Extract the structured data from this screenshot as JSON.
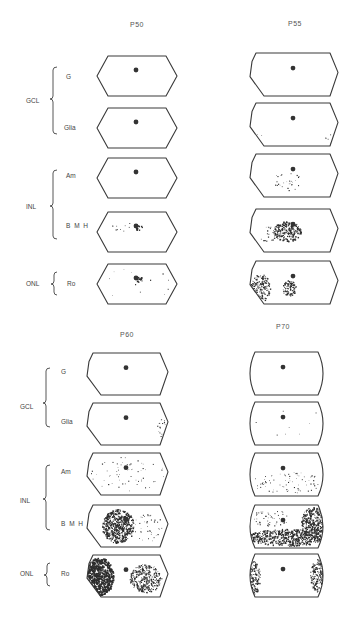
{
  "figure": {
    "panels": [
      {
        "id": "top",
        "groups": [
          {
            "label": "GCL",
            "rows": [
              "G",
              "Glia"
            ]
          },
          {
            "label": "INL",
            "rows": [
              "Am",
              "B M H"
            ]
          },
          {
            "label": "ONL",
            "rows": [
              "Ro"
            ]
          }
        ],
        "columns": [
          {
            "title": "P50"
          },
          {
            "title": "P55"
          }
        ]
      },
      {
        "id": "bottom",
        "groups": [
          {
            "label": "GCL",
            "rows": [
              "G",
              "Glia"
            ]
          },
          {
            "label": "INL",
            "rows": [
              "Am",
              "B M H"
            ]
          },
          {
            "label": "ONL",
            "rows": [
              "Ro"
            ]
          }
        ],
        "columns": [
          {
            "title": "P60"
          },
          {
            "title": "P70"
          }
        ]
      }
    ]
  },
  "chart_data": {
    "type": "heatmap",
    "title": "",
    "ages": [
      "P50",
      "P55",
      "P60",
      "P70"
    ],
    "layers": [
      "GCL",
      "GCL",
      "INL",
      "INL",
      "ONL"
    ],
    "cell_classes": [
      "G",
      "Glia",
      "Am",
      "B M H",
      "Ro"
    ],
    "maps": [
      {
        "age": "P50",
        "class": "G",
        "density": "none",
        "pattern": "optic disc only"
      },
      {
        "age": "P50",
        "class": "Glia",
        "density": "none",
        "pattern": "optic disc only"
      },
      {
        "age": "P50",
        "class": "Am",
        "density": "none",
        "pattern": "optic disc only"
      },
      {
        "age": "P50",
        "class": "B M H",
        "density": "sparse",
        "pattern": "small cluster at optic disc, few scattered left of disc"
      },
      {
        "age": "P50",
        "class": "Ro",
        "density": "sparse",
        "pattern": "small cluster at optic disc, few at periphery"
      },
      {
        "age": "P55",
        "class": "G",
        "density": "none",
        "pattern": "optic disc only"
      },
      {
        "age": "P55",
        "class": "Glia",
        "density": "very sparse",
        "pattern": "few points at lower edges"
      },
      {
        "age": "P55",
        "class": "Am",
        "density": "sparse",
        "pattern": "scattered below/left of disc"
      },
      {
        "age": "P55",
        "class": "B M H",
        "density": "moderate",
        "pattern": "dense cluster left-center around disc"
      },
      {
        "age": "P55",
        "class": "Ro",
        "density": "moderate",
        "pattern": "dense at left periphery, cluster below disc"
      },
      {
        "age": "P60",
        "class": "G",
        "density": "none",
        "pattern": "optic disc only"
      },
      {
        "age": "P60",
        "class": "Glia",
        "density": "very sparse",
        "pattern": "few points at right edge"
      },
      {
        "age": "P60",
        "class": "Am",
        "density": "sparse",
        "pattern": "scattered throughout, mostly periphery"
      },
      {
        "age": "P60",
        "class": "B M H",
        "density": "high",
        "pattern": "dense ring band left of disc"
      },
      {
        "age": "P60",
        "class": "Ro",
        "density": "high",
        "pattern": "solid left region, dense right region"
      },
      {
        "age": "P70",
        "class": "G",
        "density": "none",
        "pattern": "optic disc only"
      },
      {
        "age": "P70",
        "class": "Glia",
        "density": "very sparse",
        "pattern": "few scattered points"
      },
      {
        "age": "P70",
        "class": "Am",
        "density": "sparse",
        "pattern": "scattered, mostly lower half"
      },
      {
        "age": "P70",
        "class": "B M H",
        "density": "high",
        "pattern": "dense lower half and right side"
      },
      {
        "age": "P70",
        "class": "Ro",
        "density": "moderate",
        "pattern": "dense at left and right periphery"
      }
    ]
  },
  "layout": {
    "shapes": [
      {
        "col": "P50",
        "x": 97,
        "w": 80,
        "ys": [
          56,
          108,
          158,
          212,
          264
        ],
        "h": 40,
        "disc": [
          136,
          70
        ],
        "shape": "hex"
      },
      {
        "col": "P55",
        "x": 250,
        "w": 88,
        "ys": [
          53,
          103,
          154,
          209,
          261
        ],
        "h": 43,
        "disc": [
          293,
          72
        ],
        "shape": "hex-left"
      },
      {
        "col": "P60",
        "x": 87,
        "w": 81,
        "ys": [
          353,
          403,
          453,
          505,
          555
        ],
        "h": 42,
        "disc": [
          126,
          65
        ],
        "shape": "hex-left"
      },
      {
        "col": "P70",
        "x": 245,
        "w": 83,
        "ys": [
          352,
          402,
          453,
          505,
          554
        ],
        "h": 43,
        "disc": [
          283,
          58
        ],
        "shape": "round"
      }
    ]
  }
}
